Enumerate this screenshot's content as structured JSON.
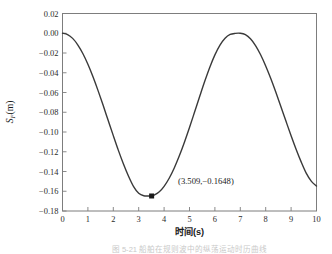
{
  "figure": {
    "background_color": "#ffffff",
    "frame_color": "#7d7d7d",
    "line_color": "#3a3a3a",
    "text_color": "#1a1a1a",
    "caption": "图 5-21  船舶在规则波中的纵荡运动时历曲线"
  },
  "chart_data": {
    "type": "line",
    "title": "",
    "xlabel": "时间(s)",
    "ylabel": "S",
    "ylabel_sub": "F",
    "ylabel_unit": "(m)",
    "xlim": [
      0,
      10
    ],
    "ylim": [
      -0.18,
      0.02
    ],
    "grid": false,
    "legend": null,
    "xticks": [
      "0",
      "1",
      "2",
      "3",
      "4",
      "5",
      "6",
      "7",
      "8",
      "9",
      "10"
    ],
    "xtick_values": [
      0,
      1,
      2,
      3,
      4,
      5,
      6,
      7,
      8,
      9,
      10
    ],
    "yticks": [
      "0.02",
      "0.00",
      "−0.02",
      "−0.04",
      "−0.06",
      "−0.08",
      "−0.10",
      "−0.12",
      "−0.14",
      "−0.16",
      "−0.18"
    ],
    "ytick_values": [
      0.02,
      0.0,
      -0.02,
      -0.04,
      -0.06,
      -0.08,
      -0.1,
      -0.12,
      -0.14,
      -0.16,
      -0.18
    ],
    "series": [
      {
        "name": "S_F",
        "x": [
          0.0,
          0.2,
          0.4,
          0.6,
          0.8,
          1.0,
          1.2,
          1.4,
          1.6,
          1.8,
          2.0,
          2.2,
          2.4,
          2.6,
          2.8,
          3.0,
          3.2,
          3.4,
          3.509,
          3.6,
          3.8,
          4.0,
          4.2,
          4.4,
          4.6,
          4.8,
          5.0,
          5.2,
          5.4,
          5.6,
          5.8,
          6.0,
          6.2,
          6.4,
          6.6,
          6.8,
          7.0,
          7.2,
          7.4,
          7.6,
          7.8,
          8.0,
          8.2,
          8.4,
          8.6,
          8.8,
          9.0,
          9.2,
          9.4,
          9.6,
          9.8,
          10.0
        ],
        "y": [
          0.0,
          -0.0013,
          -0.0052,
          -0.0117,
          -0.0205,
          -0.0314,
          -0.0441,
          -0.0581,
          -0.073,
          -0.0884,
          -0.1037,
          -0.1186,
          -0.1324,
          -0.1448,
          -0.1553,
          -0.1621,
          -0.1646,
          -0.1648,
          -0.1648,
          -0.164,
          -0.1608,
          -0.155,
          -0.1468,
          -0.1364,
          -0.1241,
          -0.1103,
          -0.0954,
          -0.0798,
          -0.0641,
          -0.0487,
          -0.0344,
          -0.0219,
          -0.012,
          -0.005,
          -0.0012,
          -0.0001,
          -0.0,
          -0.0014,
          -0.0056,
          -0.0125,
          -0.0218,
          -0.0331,
          -0.0459,
          -0.0598,
          -0.0744,
          -0.0892,
          -0.1038,
          -0.1177,
          -0.1305,
          -0.1419,
          -0.15,
          -0.1548
        ]
      }
    ],
    "markers": [
      {
        "name": "minimum-point",
        "x": 3.509,
        "y": -0.1648,
        "shape": "square",
        "color": "#1a1a1a"
      }
    ],
    "annotations": [
      {
        "name": "minimum-annotation",
        "text": "(3.509,−0.1648)",
        "x": 4.55,
        "y": -0.1525
      }
    ]
  }
}
